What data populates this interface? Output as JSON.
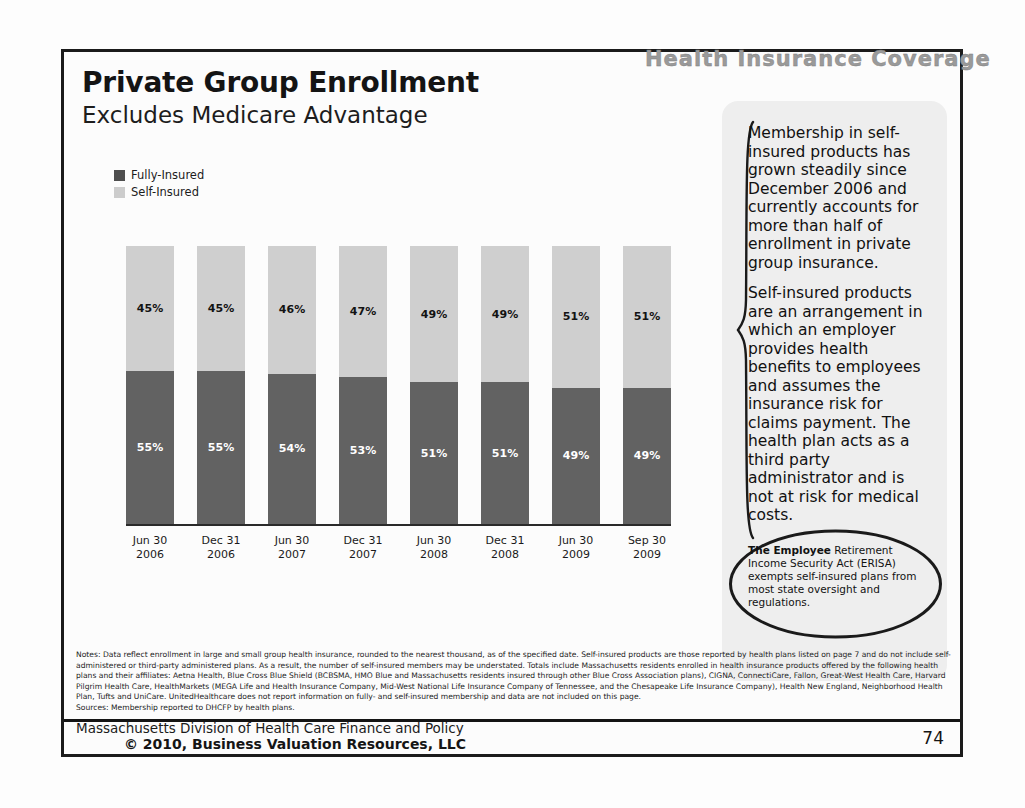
{
  "deck": {
    "header_title": "Health Insurance Coverage",
    "page_number": "74"
  },
  "slide": {
    "title": "Private Group Enrollment",
    "subtitle": "Excludes Medicare Advantage"
  },
  "legend": {
    "items": [
      {
        "label": "Fully-Insured",
        "color": "#4e4e4e"
      },
      {
        "label": "Self-Insured",
        "color": "#cccccc"
      }
    ]
  },
  "chart_data": {
    "type": "bar",
    "stacked": true,
    "title": "Private Group Enrollment",
    "subtitle": "Excludes Medicare Advantage",
    "xlabel": "",
    "ylabel": "",
    "ylim": [
      0,
      100
    ],
    "grid": false,
    "legend_position": "top-left",
    "categories": [
      "Jun 30 2006",
      "Dec 31 2006",
      "Jun 30 2007",
      "Dec 31 2007",
      "Jun 30 2008",
      "Dec 31 2008",
      "Jun 30 2009",
      "Sep 30 2009"
    ],
    "category_lines": [
      [
        "Jun 30",
        "2006"
      ],
      [
        "Dec 31",
        "2006"
      ],
      [
        "Jun 30",
        "2007"
      ],
      [
        "Dec 31",
        "2007"
      ],
      [
        "Jun 30",
        "2008"
      ],
      [
        "Dec 31",
        "2008"
      ],
      [
        "Jun 30",
        "2009"
      ],
      [
        "Sep 30",
        "2009"
      ]
    ],
    "series": [
      {
        "name": "Self-Insured",
        "color": "#cfcfcf",
        "values": [
          45,
          45,
          46,
          47,
          49,
          49,
          51,
          51
        ],
        "labels": [
          "45%",
          "45%",
          "46%",
          "47%",
          "49%",
          "49%",
          "51%",
          "51%"
        ]
      },
      {
        "name": "Fully-Insured",
        "color": "#626262",
        "values": [
          55,
          55,
          54,
          53,
          51,
          51,
          49,
          49
        ],
        "labels": [
          "55%",
          "55%",
          "54%",
          "53%",
          "51%",
          "51%",
          "49%",
          "49%"
        ]
      }
    ]
  },
  "side_panel": {
    "paragraph_1": "Membership in self-insured products has grown steadily since December 2006 and currently accounts for more than half of enrollment in private group insurance.",
    "paragraph_2": "Self-insured products are an arrangement in which an employer provides health benefits to employees and assumes the insurance risk for claims payment. The health plan acts as a third party administrator and is not at risk for medical costs."
  },
  "oval_callout": {
    "lead": "The Employee",
    "rest": " Retirement Income Security Act (ERISA) exempts self-insured plans from most state oversight and regulations."
  },
  "notes": {
    "body": "Notes: Data reflect enrollment in large and small group health insurance, rounded to the nearest thousand, as of the specified date. Self-insured products are those reported by health plans listed on page 7 and do not include self-administered or third-party administered plans. As a result, the number of self-insured members may be understated. Totals include Massachusetts residents enrolled in health insurance products offered by the following health plans and their affiliates: Aetna Health, Blue Cross Blue Shield (BCBSMA, HMO Blue and Massachusetts residents insured through other Blue Cross Association plans), CIGNA, ConnectiCare, Fallon, Great-West Health Care, Harvard Pilgrim Health Care, HealthMarkets (MEGA Life and Health Insurance Company, Mid-West National Life Insurance Company of Tennessee, and the Chesapeake Life Insurance Company), Health New England, Neighborhood Health Plan, Tufts and UniCare. UnitedHealthcare does not report information on fully- and self-insured membership and data are not included on this page.",
    "sources": "Sources: Membership reported to DHCFP by health plans."
  },
  "footer": {
    "source": "Massachusetts Division of Health Care Finance and Policy",
    "copyright": "© 2010, Business Valuation Resources, LLC"
  }
}
